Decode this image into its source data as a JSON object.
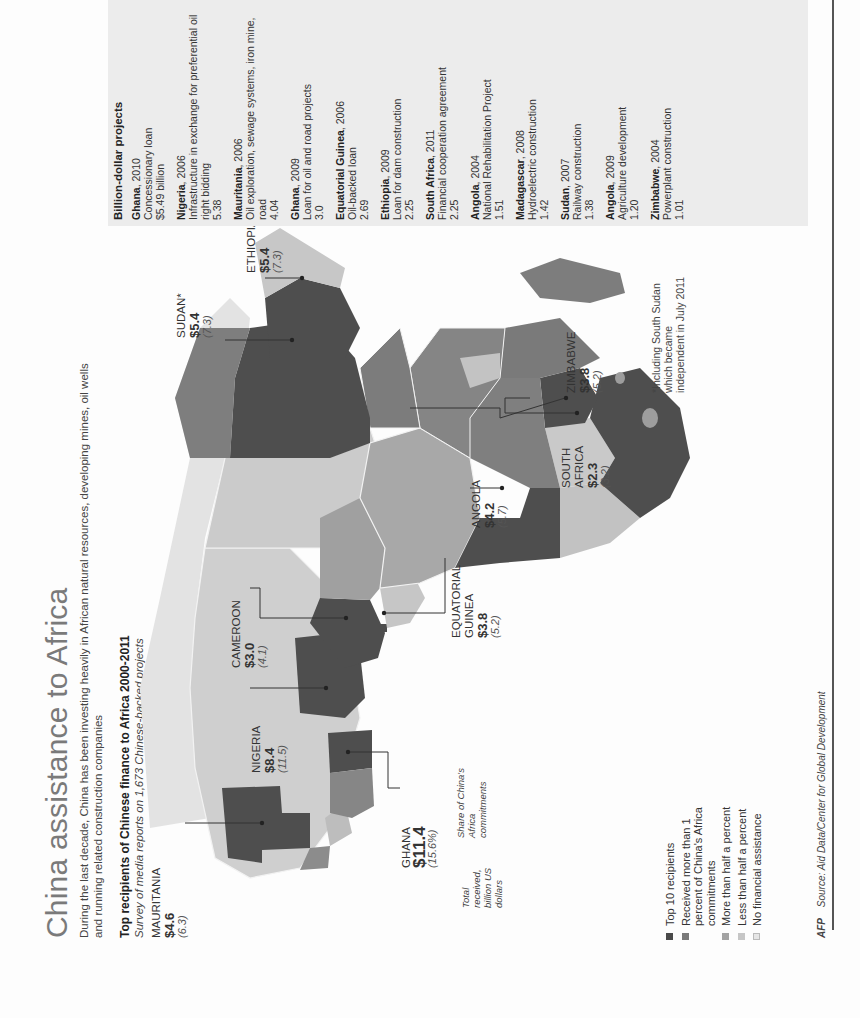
{
  "header": {
    "title": "China assistance to Africa",
    "subtitle_line1": "During the last decade, China has been investing heavily in African natural resources, developing mines, oil wells",
    "subtitle_line2": "and running related construction companies",
    "map_heading": "Top recipients of  Chinese finance to Africa 2000-2011",
    "map_subheading": "Survey of media reports on 1,673 Chinese-backed projects"
  },
  "key_annotation": {
    "total_label": "Total received, billion US dollars",
    "share_label": "Share of China's Africa commitments"
  },
  "recipients": [
    {
      "country": "Mauritania",
      "amount": "$4.6",
      "share": "(6.3)"
    },
    {
      "country": "Nigeria",
      "amount": "$8.4",
      "share": "(11.5)"
    },
    {
      "country": "Cameroon",
      "amount": "$3.0",
      "share": "(4.1)"
    },
    {
      "country": "Sudan*",
      "amount": "$5.4",
      "share": "(7.3)"
    },
    {
      "country": "Ethiopia",
      "amount": "$5.4",
      "share": "(7.3)"
    },
    {
      "country": "Ghana",
      "amount": "$11.4",
      "share": "(15.6%)"
    },
    {
      "country": "Equatorial Guinea",
      "amount": "$3.8",
      "share": "(5.2)"
    },
    {
      "country": "Angola",
      "amount": "$4.2",
      "share": "(5.7)"
    },
    {
      "country": "South Africa",
      "amount": "$2.3",
      "share": "(3.2)"
    },
    {
      "country": "Zimbabwe",
      "amount": "$3.8",
      "share": "(5.2)"
    }
  ],
  "footnote": "*Including South Sudan which became independent in July 2011",
  "legend": {
    "items": [
      {
        "label": "Top 10 recipients",
        "color": "#4a4a4a"
      },
      {
        "label": "Received more than 1 percent of China's Africa commitments",
        "color": "#7a7a7a"
      },
      {
        "label": "More than half a percent",
        "color": "#a3a3a3"
      },
      {
        "label": "Less than half a percent",
        "color": "#c6c6c6"
      },
      {
        "label": "No financial assistance",
        "color": "#e6e6e6"
      }
    ]
  },
  "source": {
    "brand": "AFP",
    "text": "Source: Aid Data/Center for Global Development"
  },
  "projects_panel": {
    "heading": "Billion-dollar projects",
    "items": [
      {
        "country": "Ghana",
        "year": ", 2010",
        "desc": "Concessionary loan",
        "value": "$5.49 billion"
      },
      {
        "country": "Nigeria",
        "year": ", 2006",
        "desc": "Infrastructure in exchange for preferential oil right bidding",
        "value": "5.38"
      },
      {
        "country": "Mauritania",
        "year": ", 2006",
        "desc": "Oil exploration, sewage systems, iron mine, road",
        "value": "4.04"
      },
      {
        "country": "Ghana",
        "year": ", 2009",
        "desc": "Loan for oil and road projects",
        "value": "3.0"
      },
      {
        "country": "Equatorial Guinea",
        "year": ", 2006",
        "desc": "Oil-backed loan",
        "value": "2.69"
      },
      {
        "country": "Ethiopia",
        "year": ", 2009",
        "desc": "Loan for dam construction",
        "value": "2.25"
      },
      {
        "country": "South Africa",
        "year": ", 2011",
        "desc": "Financial cooperation agreement",
        "value": "2.25"
      },
      {
        "country": "Angola",
        "year": ", 2004",
        "desc": "National Rehabilitation Project",
        "value": "1.51"
      },
      {
        "country": "Madagascar",
        "year": ", 2008",
        "desc": "Hydroelectric construction",
        "value": "1.42"
      },
      {
        "country": "Sudan",
        "year": ", 2007",
        "desc": "Railway construction",
        "value": "1.38"
      },
      {
        "country": "Angola",
        "year": ", 2009",
        "desc": "Agriculture development",
        "value": "1.20"
      },
      {
        "country": "Zimbabwe",
        "year": ", 2004",
        "desc": "Powerplant construction",
        "value": "1.01"
      }
    ]
  },
  "colors": {
    "top10": "#4a4a4a",
    "over1pct": "#7a7a7a",
    "over_half": "#a3a3a3",
    "under_half": "#c6c6c6",
    "none": "#e6e6e6",
    "panel_bg": "#ececec"
  }
}
